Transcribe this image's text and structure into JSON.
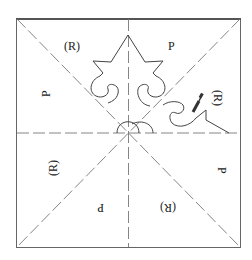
{
  "diagram": {
    "stroke_color": "#555555",
    "dash_color": "#777777",
    "labels": [
      {
        "id": "top-left-R",
        "text": "(R)",
        "x": 72,
        "y": 50,
        "rotate": 0
      },
      {
        "id": "top-right-P",
        "text": "P",
        "x": 172,
        "y": 50,
        "rotate": 0
      },
      {
        "id": "left-upper-P",
        "text": "P",
        "x": 46,
        "y": 92,
        "rotate": -90
      },
      {
        "id": "right-upper-R",
        "text": "(R)",
        "x": 218,
        "y": 100,
        "rotate": 90
      },
      {
        "id": "left-lower-R",
        "text": "(R)",
        "x": 52,
        "y": 166,
        "rotate": -90
      },
      {
        "id": "right-lower-P",
        "text": "P",
        "x": 222,
        "y": 172,
        "rotate": 90
      },
      {
        "id": "bottom-left-P",
        "text": "P",
        "x": 100,
        "y": 208,
        "rotate": 180
      },
      {
        "id": "bottom-right-R",
        "text": "(R)",
        "x": 167,
        "y": 208,
        "rotate": 180
      }
    ]
  }
}
